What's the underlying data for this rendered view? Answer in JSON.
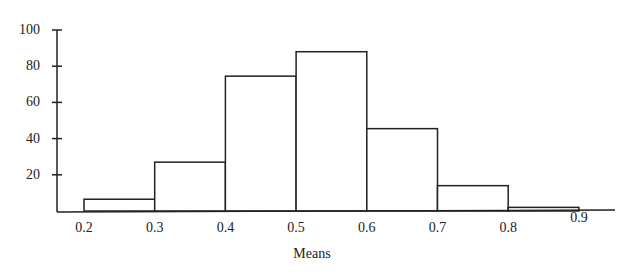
{
  "chart_data": {
    "type": "bar",
    "subtype": "histogram",
    "title": "",
    "xlabel": "Means",
    "ylabel": "",
    "bin_edges": [
      0.2,
      0.3,
      0.4,
      0.5,
      0.6,
      0.7,
      0.8,
      0.9
    ],
    "categories": [
      "0.2-0.3",
      "0.3-0.4",
      "0.4-0.5",
      "0.5-0.6",
      "0.6-0.7",
      "0.7-0.8",
      "0.8-0.9"
    ],
    "values": [
      6.5,
      27,
      74.5,
      88,
      45.5,
      14,
      2
    ],
    "x_tick_labels": [
      "0.2",
      "0.3",
      "0.4",
      "0.5",
      "0.6",
      "0.7",
      "0.8",
      "0.9"
    ],
    "y_tick_labels": [
      "20",
      "40",
      "60",
      "80",
      "100"
    ],
    "y_ticks": [
      20,
      40,
      60,
      80,
      100
    ],
    "ylim": [
      0,
      100
    ],
    "xlim": [
      0.15,
      0.95
    ],
    "grid": false,
    "legend": null,
    "colors": {
      "bar_fill": "#ffffff",
      "bar_stroke": "#222222",
      "axis": "#222222"
    }
  }
}
